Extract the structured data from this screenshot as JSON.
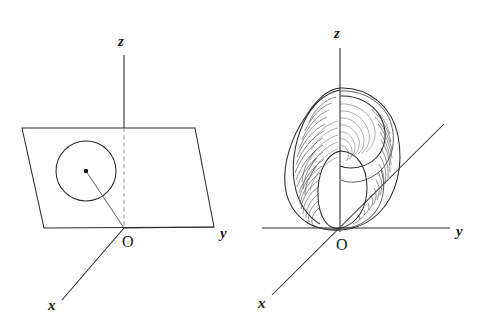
{
  "figure": {
    "background_color": "#ffffff",
    "ink_color": "#2a2a2a",
    "width": 481,
    "height": 327
  },
  "left_diagram": {
    "name": "circle-in-plane",
    "caption": "Circle lying in a vertical plane containing the z-axis direction",
    "labels": {
      "z": "z",
      "y": "y",
      "x": "x",
      "origin": "O"
    },
    "axes": {
      "z_axis": {
        "from": [
          124,
          228
        ],
        "to": [
          124,
          55
        ],
        "style": "solid-above-plane, dashed-inside-plane"
      },
      "y_axis": {
        "from": [
          124,
          228
        ],
        "to": [
          214,
          228
        ],
        "style": "solid"
      },
      "x_axis": {
        "from": [
          124,
          228
        ],
        "to": [
          62,
          300
        ],
        "style": "solid"
      }
    },
    "plane": {
      "type": "parallelogram",
      "corners": [
        [
          22,
          128
        ],
        [
          195,
          128
        ],
        [
          214,
          227
        ],
        [
          44,
          228
        ]
      ]
    },
    "circle": {
      "center": [
        86,
        171
      ],
      "radius": 30,
      "center_dot_radius": 2.2,
      "radius_line_to": [
        124,
        228
      ]
    }
  },
  "right_diagram": {
    "name": "torus-of-revolution",
    "caption": "Torus generated by revolving the circle about the z-axis, shown with hatched shading",
    "labels": {
      "z": "z",
      "y": "y",
      "x": "x",
      "origin": "O"
    },
    "axes": {
      "z_axis": {
        "from": [
          340,
          228
        ],
        "to": [
          340,
          48
        ],
        "style": "solid"
      },
      "y_axis": {
        "from": [
          340,
          228
        ],
        "to": [
          450,
          228
        ],
        "style": "solid"
      },
      "x_axis": {
        "from": [
          272,
          295
        ],
        "to": [
          444,
          124
        ],
        "style": "solid-through-origin"
      }
    },
    "surface": {
      "outer_outline_bbox": [
        299,
        88,
        399,
        229
      ],
      "inner_hole_bbox": [
        318,
        150,
        366,
        229
      ],
      "hatch_line_count": 46,
      "shading": "contour hatching following the tube of the torus"
    }
  }
}
